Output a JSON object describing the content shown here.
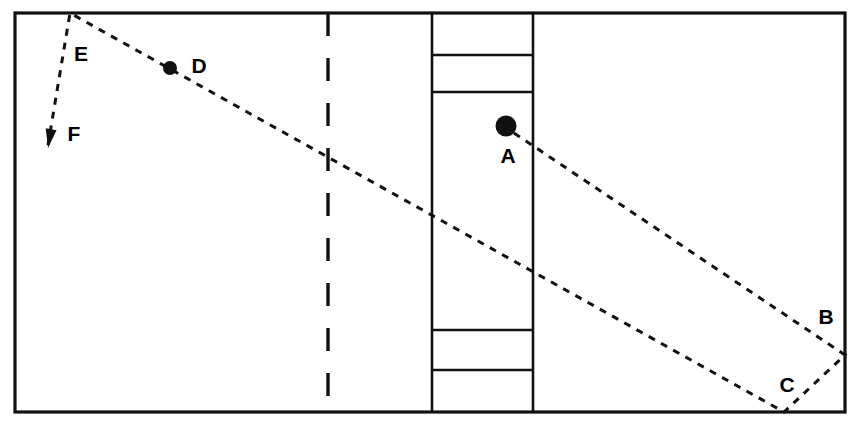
{
  "figure": {
    "background_color": "#ffffff",
    "ink_color": "#111111",
    "width": 849,
    "height": 424
  },
  "table": {
    "name": "table-outline",
    "x": 15,
    "y": 13,
    "width": 830,
    "height": 399,
    "stroke_width": 3.2
  },
  "center_column": {
    "name": "center-column",
    "left_x": 432,
    "right_x": 533,
    "top_y": 13,
    "bottom_y": 412,
    "stroke_width": 2.6,
    "dividers_y": [
      55,
      92,
      330,
      370
    ]
  },
  "dashed_divider": {
    "name": "vertical-dashed-divider",
    "x": 328,
    "y_top": 13,
    "y_bottom": 412,
    "stroke_width": 3.4,
    "dash": "23 22"
  },
  "paths": {
    "stroke_width": 3.0,
    "dash": "7 7",
    "ray_a": {
      "name": "ray-path-a-to-b-to-c",
      "points": [
        {
          "x": 514,
          "y": 133
        },
        {
          "x": 845,
          "y": 355
        },
        {
          "x": 784,
          "y": 412
        },
        {
          "x": 70,
          "y": 13
        },
        {
          "x": 48,
          "y": 145
        }
      ]
    }
  },
  "balls": [
    {
      "id": "A",
      "name": "ball-a",
      "cx": 506,
      "cy": 126,
      "r": 10.5,
      "label": "A",
      "label_x": 508,
      "label_y": 157
    },
    {
      "id": "D",
      "name": "ball-d",
      "cx": 170,
      "cy": 68,
      "r": 7.0,
      "label": "D",
      "label_x": 199,
      "label_y": 67
    }
  ],
  "point_labels": [
    {
      "id": "A",
      "name": "point-label-a",
      "text": "A",
      "x": 508,
      "y": 157
    },
    {
      "id": "B",
      "name": "point-label-b",
      "text": "B",
      "x": 826,
      "y": 318
    },
    {
      "id": "C",
      "name": "point-label-c",
      "text": "C",
      "x": 787,
      "y": 386
    },
    {
      "id": "D",
      "name": "point-label-d",
      "text": "D",
      "x": 199,
      "y": 67
    },
    {
      "id": "E",
      "name": "point-label-e",
      "text": "E",
      "x": 81,
      "y": 55
    },
    {
      "id": "F",
      "name": "point-label-f",
      "text": "F",
      "x": 74,
      "y": 135
    }
  ],
  "arrow": {
    "name": "direction-arrowhead-f",
    "tip_x": 48,
    "tip_y": 148,
    "angle_deg": 99.5,
    "length": 19,
    "half_width": 5.5
  }
}
